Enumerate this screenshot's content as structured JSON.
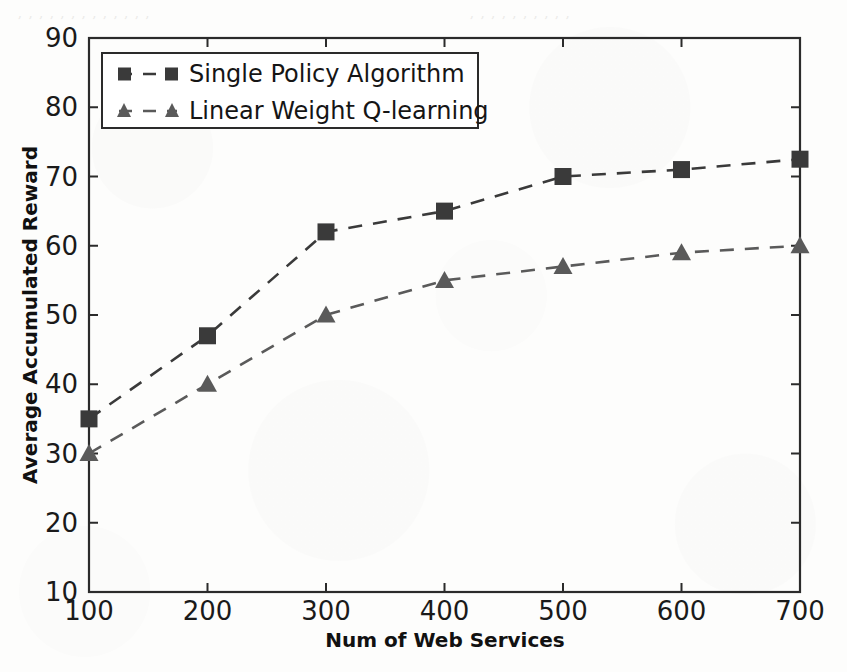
{
  "figure": {
    "background_color": "#fdfdfc",
    "ink_color": "#2b2b2b"
  },
  "scan_artifacts": {
    "description": "faint reverse-page bleed-through along the top margin",
    "lines": [
      "  , ,  ,     ,     ,  ,     ,      ,   ,   ,    ,     ,   ,    ",
      "   ,    ,    ,      ,    ,    ,      ,    ,     ,     ,    "
    ]
  },
  "chart_data": {
    "type": "line",
    "title": "",
    "xlabel": "Num of Web Services",
    "ylabel": "Average Accumulated Reward",
    "x": [
      100,
      200,
      300,
      400,
      500,
      600,
      700
    ],
    "xlim": [
      100,
      700
    ],
    "ylim": [
      10,
      90
    ],
    "xticks": [
      100,
      200,
      300,
      400,
      500,
      600,
      700
    ],
    "yticks": [
      10,
      20,
      30,
      40,
      50,
      60,
      70,
      80,
      90
    ],
    "xticklabels": [
      "100",
      "200",
      "300",
      "400",
      "500",
      "600",
      "700"
    ],
    "yticklabels": [
      "10",
      "20",
      "30",
      "40",
      "50",
      "60",
      "70",
      "80",
      "90"
    ],
    "grid": false,
    "legend_position": "upper left",
    "series": [
      {
        "name": "Single Policy Algorithm",
        "marker": "square",
        "linestyle": "dashed",
        "color": "#3a3a3a",
        "values": [
          35,
          47,
          62,
          65,
          70,
          71,
          72.5
        ]
      },
      {
        "name": "Linear Weight Q-learning",
        "marker": "triangle",
        "linestyle": "dashed",
        "color": "#5a5a5a",
        "values": [
          30,
          40,
          50,
          55,
          57,
          59,
          60
        ]
      }
    ]
  },
  "legend": {
    "items": [
      {
        "label": "Single Policy Algorithm"
      },
      {
        "label": "Linear Weight Q-learning"
      }
    ]
  }
}
